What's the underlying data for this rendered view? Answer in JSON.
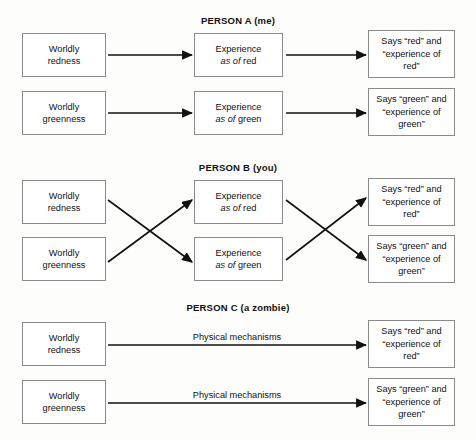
{
  "figure": {
    "background_color": "#fdfdfb",
    "box_border_color": "#8a8a8a",
    "arrow_color": "#111111"
  },
  "sections": [
    {
      "id": "person-a",
      "title": "PERSON A (me)",
      "title_x": 238,
      "title_y": 15,
      "boxes": [
        {
          "name": "worldly-redness",
          "text": "Worldly\nredness",
          "x": 22,
          "y": 33,
          "w": 84,
          "h": 44
        },
        {
          "name": "worldly-greenness",
          "text": "Worldly\ngreenness",
          "x": 22,
          "y": 91,
          "w": 84,
          "h": 44
        },
        {
          "name": "experience-red",
          "text": "Experience\nas of red",
          "italic_prefix": "as of",
          "x": 194,
          "y": 33,
          "w": 89,
          "h": 44
        },
        {
          "name": "experience-green",
          "text": "Experience\nas of green",
          "italic_prefix": "as of",
          "x": 194,
          "y": 91,
          "w": 89,
          "h": 44
        },
        {
          "name": "says-red",
          "text": "Says “red” and\n“experience of\nred”",
          "x": 368,
          "y": 30,
          "w": 87,
          "h": 48
        },
        {
          "name": "says-green",
          "text": "Says “green” and\n“experience of\ngreen”",
          "x": 368,
          "y": 88,
          "w": 87,
          "h": 48
        }
      ],
      "arrows": [
        {
          "name": "arrow-redness-to-experience-red",
          "x1": 108,
          "y1": 55,
          "x2": 192,
          "y2": 55
        },
        {
          "name": "arrow-greenness-to-experience-green",
          "x1": 108,
          "y1": 113,
          "x2": 192,
          "y2": 113
        },
        {
          "name": "arrow-experience-red-to-says-red",
          "x1": 286,
          "y1": 55,
          "x2": 366,
          "y2": 55
        },
        {
          "name": "arrow-experience-green-to-says-green",
          "x1": 286,
          "y1": 113,
          "x2": 366,
          "y2": 113
        }
      ],
      "edge_labels": []
    },
    {
      "id": "person-b",
      "title": "PERSON B (you)",
      "title_x": 238,
      "title_y": 162,
      "boxes": [
        {
          "name": "worldly-redness",
          "text": "Worldly\nredness",
          "x": 22,
          "y": 180,
          "w": 84,
          "h": 44
        },
        {
          "name": "worldly-greenness",
          "text": "Worldly\ngreenness",
          "x": 22,
          "y": 237,
          "w": 84,
          "h": 44
        },
        {
          "name": "experience-red",
          "text": "Experience\nas of red",
          "italic_prefix": "as of",
          "x": 194,
          "y": 180,
          "w": 89,
          "h": 44
        },
        {
          "name": "experience-green",
          "text": "Experience\nas of green",
          "italic_prefix": "as of",
          "x": 194,
          "y": 237,
          "w": 89,
          "h": 44
        },
        {
          "name": "says-red",
          "text": "Says “red” and\n“experience of\nred”",
          "x": 368,
          "y": 178,
          "w": 87,
          "h": 48
        },
        {
          "name": "says-green",
          "text": "Says “green” and\n“experience of\ngreen”",
          "x": 368,
          "y": 235,
          "w": 87,
          "h": 48
        }
      ],
      "arrows": [
        {
          "name": "arrow-redness-to-experience-green",
          "x1": 108,
          "y1": 200,
          "x2": 192,
          "y2": 262
        },
        {
          "name": "arrow-greenness-to-experience-red",
          "x1": 108,
          "y1": 262,
          "x2": 192,
          "y2": 200
        },
        {
          "name": "arrow-experience-red-to-says-green",
          "x1": 286,
          "y1": 200,
          "x2": 366,
          "y2": 260
        },
        {
          "name": "arrow-experience-green-to-says-red",
          "x1": 286,
          "y1": 260,
          "x2": 366,
          "y2": 198
        }
      ],
      "edge_labels": []
    },
    {
      "id": "person-c",
      "title": "PERSON C (a zombie)",
      "title_x": 238,
      "title_y": 302,
      "boxes": [
        {
          "name": "worldly-redness",
          "text": "Worldly\nredness",
          "x": 22,
          "y": 322,
          "w": 84,
          "h": 44
        },
        {
          "name": "worldly-greenness",
          "text": "Worldly\ngreenness",
          "x": 22,
          "y": 380,
          "w": 84,
          "h": 44
        },
        {
          "name": "says-red",
          "text": "Says “red” and\n“experience of\nred”",
          "x": 368,
          "y": 320,
          "w": 87,
          "h": 48
        },
        {
          "name": "says-green",
          "text": "Says “green” and\n“experience of\ngreen”",
          "x": 368,
          "y": 378,
          "w": 87,
          "h": 48
        }
      ],
      "arrows": [
        {
          "name": "arrow-redness-to-says-red",
          "x1": 108,
          "y1": 345,
          "x2": 366,
          "y2": 345
        },
        {
          "name": "arrow-greenness-to-says-green",
          "x1": 108,
          "y1": 403,
          "x2": 366,
          "y2": 403
        }
      ],
      "edge_labels": [
        {
          "name": "physical-mechanisms-red",
          "text": "Physical mechanisms",
          "x": 237,
          "y": 332
        },
        {
          "name": "physical-mechanisms-green",
          "text": "Physical mechanisms",
          "x": 237,
          "y": 390
        }
      ]
    }
  ]
}
